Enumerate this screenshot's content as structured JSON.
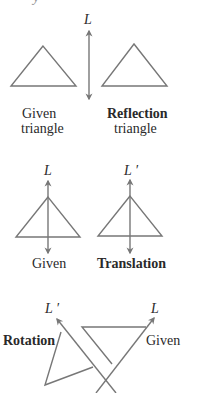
{
  "colors": {
    "stroke": "#777777",
    "text": "#2a2a2a"
  },
  "top_fragment": "y",
  "reflection": {
    "axis_label": "L",
    "given_label_1": "Given",
    "given_label_2": "triangle",
    "result_label_1": "Reflection",
    "result_label_2": "triangle"
  },
  "translation": {
    "axis_label_given": "L",
    "axis_label_result": "L ′",
    "given_label": "Given",
    "result_label": "Translation"
  },
  "rotation": {
    "axis_label_result": "L ′",
    "axis_label_given": "L",
    "result_label": "Rotation",
    "given_label": "Given"
  }
}
